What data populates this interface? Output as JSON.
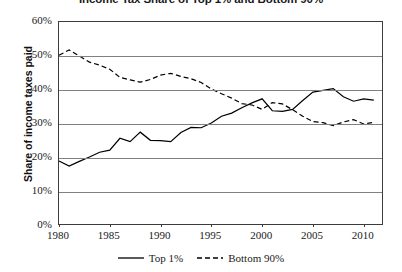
{
  "chart_data": {
    "type": "line",
    "title": "Income Tax Share of Top 1% and Bottom 90%",
    "xlabel": "",
    "ylabel": "Share of income taxes paid",
    "xlim": [
      1980,
      2012
    ],
    "ylim": [
      0,
      60
    ],
    "grid": true,
    "grid_axis": "y",
    "legend_position": "bottom-center",
    "y_ticks": [
      0,
      10,
      20,
      30,
      40,
      50,
      60
    ],
    "y_tick_labels": [
      "0%",
      "10%",
      "20%",
      "30%",
      "40%",
      "50%",
      "60%"
    ],
    "x_ticks": [
      1980,
      1985,
      1990,
      1995,
      2000,
      2005,
      2010
    ],
    "x_tick_labels": [
      "1980",
      "1985",
      "1990",
      "1995",
      "2000",
      "2005",
      "2010"
    ],
    "x": [
      1980,
      1981,
      1982,
      1983,
      1984,
      1985,
      1986,
      1987,
      1988,
      1989,
      1990,
      1991,
      1992,
      1993,
      1994,
      1995,
      1996,
      1997,
      1998,
      1999,
      2000,
      2001,
      2002,
      2003,
      2004,
      2005,
      2006,
      2007,
      2008,
      2009,
      2010,
      2011
    ],
    "series": [
      {
        "name": "Top 1%",
        "style": "solid",
        "color": "#000000",
        "values": [
          19.1,
          17.6,
          19.0,
          20.3,
          21.7,
          22.3,
          25.8,
          24.8,
          27.6,
          25.2,
          25.1,
          24.8,
          27.5,
          29.0,
          28.9,
          30.3,
          32.3,
          33.2,
          34.8,
          36.2,
          37.4,
          33.9,
          33.7,
          34.3,
          36.9,
          39.4,
          39.9,
          40.4,
          38.0,
          36.7,
          37.4,
          37.0
        ]
      },
      {
        "name": "Bottom 90%",
        "style": "dashed",
        "color": "#000000",
        "values": [
          50.2,
          51.8,
          50.0,
          48.2,
          47.3,
          46.1,
          43.7,
          43.0,
          42.3,
          43.1,
          44.4,
          44.9,
          44.0,
          43.3,
          42.2,
          40.3,
          38.9,
          37.6,
          36.0,
          35.6,
          34.3,
          36.3,
          35.9,
          34.2,
          32.3,
          30.7,
          30.4,
          29.5,
          30.6,
          31.3,
          30.0,
          30.5
        ]
      }
    ]
  },
  "legend": {
    "items": [
      {
        "label": "Top 1%",
        "style": "solid"
      },
      {
        "label": "Bottom 90%",
        "style": "dashed"
      }
    ]
  }
}
